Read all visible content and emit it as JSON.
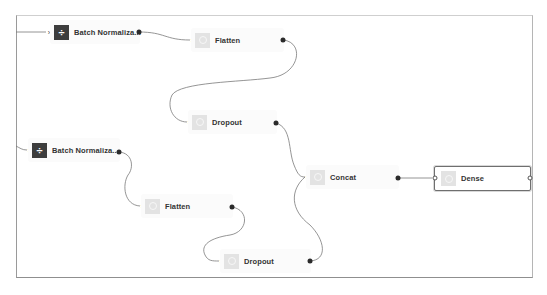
{
  "canvas": {
    "nodes": [
      {
        "id": "bn1",
        "label": "Batch Normaliza...",
        "icon": "divide-icon",
        "type": "batch-normalization"
      },
      {
        "id": "flatten1",
        "label": "Flatten",
        "icon": "layer-circle-icon",
        "type": "flatten"
      },
      {
        "id": "dropout1",
        "label": "Dropout",
        "icon": "layer-circle-icon",
        "type": "dropout"
      },
      {
        "id": "bn2",
        "label": "Batch Normaliza...",
        "icon": "divide-icon",
        "type": "batch-normalization"
      },
      {
        "id": "flatten2",
        "label": "Flatten",
        "icon": "layer-circle-icon",
        "type": "flatten"
      },
      {
        "id": "dropout2",
        "label": "Dropout",
        "icon": "layer-circle-icon",
        "type": "dropout"
      },
      {
        "id": "concat",
        "label": "Concat",
        "icon": "layer-circle-icon",
        "type": "concat"
      },
      {
        "id": "dense",
        "label": "Dense",
        "icon": "layer-circle-icon",
        "type": "dense",
        "selected": true
      }
    ],
    "edges": [
      {
        "from": "external",
        "to": "bn1"
      },
      {
        "from": "bn1",
        "to": "flatten1"
      },
      {
        "from": "flatten1",
        "to": "dropout1"
      },
      {
        "from": "dropout1",
        "to": "concat"
      },
      {
        "from": "external",
        "to": "bn2"
      },
      {
        "from": "bn2",
        "to": "flatten2"
      },
      {
        "from": "flatten2",
        "to": "dropout2"
      },
      {
        "from": "dropout2",
        "to": "concat"
      },
      {
        "from": "concat",
        "to": "dense"
      }
    ]
  },
  "colors": {
    "edge": "#707070",
    "port": "#2b2b2b",
    "dark_icon": "#3d3d3d",
    "light_icon": "#e3e3e3",
    "selected_border": "#6f6f6f"
  }
}
